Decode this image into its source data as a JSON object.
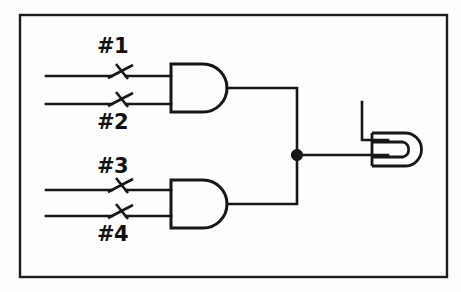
{
  "figure": {
    "kind": "schematic-diagram",
    "background_color": "#fdfdfc",
    "ink_color": "#17171a",
    "frame": {
      "x": 19,
      "y": 14,
      "width": 428,
      "height": 263
    }
  },
  "switch_labels": {
    "s1": "#1",
    "s2": "#2",
    "s3": "#3",
    "s4": "#4"
  },
  "switches": [
    {
      "id": "s1",
      "label": "#1",
      "state": "open",
      "pivot_x": 112,
      "pivot_y": 76
    },
    {
      "id": "s2",
      "label": "#2",
      "state": "open",
      "pivot_x": 112,
      "pivot_y": 104
    },
    {
      "id": "s3",
      "label": "#3",
      "state": "open",
      "pivot_x": 112,
      "pivot_y": 190
    },
    {
      "id": "s4",
      "label": "#4",
      "state": "open",
      "pivot_x": 112,
      "pivot_y": 216
    }
  ],
  "gates": [
    {
      "id": "and-top",
      "type": "AND",
      "inputs": [
        "s1",
        "s2"
      ],
      "x": 171,
      "y": 64,
      "width": 62,
      "height": 48
    },
    {
      "id": "and-bottom",
      "type": "AND",
      "inputs": [
        "s3",
        "s4"
      ],
      "x": 171,
      "y": 180,
      "width": 62,
      "height": 48
    }
  ],
  "junction": {
    "id": "output-junction",
    "x": 297,
    "y": 155,
    "radius": 5.5
  },
  "load": {
    "id": "load-element",
    "type": "U-loop",
    "x": 362,
    "y": 102
  }
}
